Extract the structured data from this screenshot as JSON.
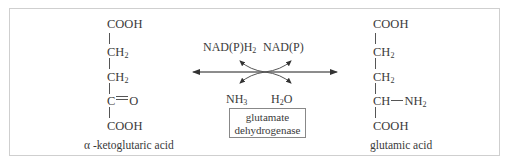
{
  "diagram": {
    "substrate": {
      "name": "α -ketoglutaric acid",
      "groups": [
        "COOH",
        "CH2",
        "CH2",
        "C=O",
        "COOH"
      ]
    },
    "product": {
      "name": "glutamic acid",
      "groups": [
        "COOH",
        "CH2",
        "CH2",
        "CH—NH2",
        "COOH"
      ]
    },
    "cofactors": {
      "top_left": "NAD(P)H2",
      "top_right": "NAD(P)",
      "bottom_left": "NH3",
      "bottom_right": "H2O"
    },
    "enzyme": {
      "line1": "glutamate",
      "line2": "dehydrogenase"
    },
    "reaction_direction": "reversible",
    "colors": {
      "text": "#3a3a3a",
      "lines": "#555555",
      "frame": "#cfcfcf"
    }
  }
}
